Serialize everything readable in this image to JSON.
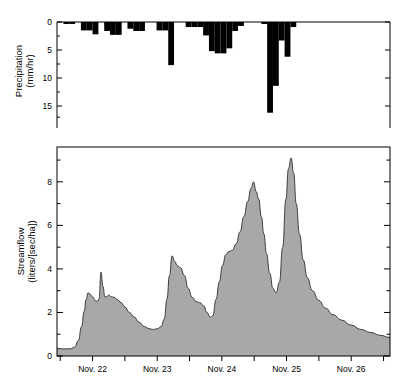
{
  "figure": {
    "background_color": "#ffffff",
    "axis_color": "#000000",
    "precip_bar_color": "#000000",
    "streamflow_fill_color": "#a8a8a8",
    "streamflow_line_color": "#3d3d3d"
  },
  "precip_panel": {
    "y_axis_title_line1": "Precipitation",
    "y_axis_title_line2": "(mm/hr)",
    "y_ticks": [
      "0",
      "5",
      "10",
      "15"
    ]
  },
  "flow_panel": {
    "y_axis_title_line1": "Streamflow",
    "y_axis_title_line2": "(liters/[sec/ha])",
    "y_ticks": [
      "0",
      "2",
      "4",
      "6",
      "8"
    ],
    "x_ticks": [
      "Nov. 22",
      "Nov. 23",
      "Nov. 24",
      "Nov. 25",
      "Nov. 26"
    ]
  },
  "chart_data": [
    {
      "type": "bar",
      "title": "",
      "xlabel": "",
      "ylabel": "Precipitation (mm/hr)",
      "y_axis_inverted": true,
      "ylim": [
        0,
        17.5
      ],
      "yticks": [
        0,
        5,
        10,
        15
      ],
      "xlim": [
        21.45,
        26.6
      ],
      "x_unit": "day of November",
      "bar_width_days": 0.09,
      "grid": false,
      "legend": null,
      "bars": [
        {
          "x": 21.55,
          "value": 0.35
        },
        {
          "x": 21.64,
          "value": 0.35
        },
        {
          "x": 21.73,
          "value": 0.0
        },
        {
          "x": 21.82,
          "value": 1.5
        },
        {
          "x": 21.91,
          "value": 1.5
        },
        {
          "x": 22.0,
          "value": 2.2
        },
        {
          "x": 22.09,
          "value": 0.0
        },
        {
          "x": 22.18,
          "value": 1.6
        },
        {
          "x": 22.27,
          "value": 2.3
        },
        {
          "x": 22.36,
          "value": 2.3
        },
        {
          "x": 22.45,
          "value": 0.0
        },
        {
          "x": 22.54,
          "value": 1.2
        },
        {
          "x": 22.63,
          "value": 1.6
        },
        {
          "x": 22.72,
          "value": 1.6
        },
        {
          "x": 22.81,
          "value": 0.0
        },
        {
          "x": 22.9,
          "value": 0.0
        },
        {
          "x": 22.99,
          "value": 1.5
        },
        {
          "x": 23.08,
          "value": 1.5
        },
        {
          "x": 23.17,
          "value": 7.7
        },
        {
          "x": 23.26,
          "value": 0.0
        },
        {
          "x": 23.35,
          "value": 0.0
        },
        {
          "x": 23.44,
          "value": 0.9
        },
        {
          "x": 23.53,
          "value": 0.9
        },
        {
          "x": 23.62,
          "value": 0.9
        },
        {
          "x": 23.71,
          "value": 2.4
        },
        {
          "x": 23.8,
          "value": 5.2
        },
        {
          "x": 23.89,
          "value": 5.6
        },
        {
          "x": 23.98,
          "value": 5.6
        },
        {
          "x": 24.07,
          "value": 4.7
        },
        {
          "x": 24.16,
          "value": 1.6
        },
        {
          "x": 24.25,
          "value": 0.7
        },
        {
          "x": 24.34,
          "value": 0.0
        },
        {
          "x": 24.43,
          "value": 0.0
        },
        {
          "x": 24.52,
          "value": 0.0
        },
        {
          "x": 24.61,
          "value": 0.35
        },
        {
          "x": 24.7,
          "value": 16.2
        },
        {
          "x": 24.79,
          "value": 11.4
        },
        {
          "x": 24.88,
          "value": 3.3
        },
        {
          "x": 24.97,
          "value": 6.2
        },
        {
          "x": 25.06,
          "value": 0.9
        },
        {
          "x": 25.15,
          "value": 0.0
        },
        {
          "x": 25.24,
          "value": 0.0
        },
        {
          "x": 25.33,
          "value": 0.0
        },
        {
          "x": 25.42,
          "value": 0.0
        },
        {
          "x": 25.51,
          "value": 0.0
        },
        {
          "x": 25.6,
          "value": 0.0
        },
        {
          "x": 25.69,
          "value": 0.0
        },
        {
          "x": 25.78,
          "value": 0.0
        },
        {
          "x": 25.87,
          "value": 0.0
        },
        {
          "x": 25.96,
          "value": 0.0
        },
        {
          "x": 26.05,
          "value": 0.0
        },
        {
          "x": 26.14,
          "value": 0.0
        },
        {
          "x": 26.23,
          "value": 0.0
        },
        {
          "x": 26.32,
          "value": 0.0
        },
        {
          "x": 26.41,
          "value": 0.0
        },
        {
          "x": 26.5,
          "value": 0.0
        }
      ]
    },
    {
      "type": "area",
      "title": "",
      "xlabel": "",
      "ylabel": "Streamflow (liters/[sec/ha])",
      "ylim": [
        0,
        9.6
      ],
      "yticks": [
        0,
        2,
        4,
        6,
        8
      ],
      "xlim": [
        21.45,
        26.6
      ],
      "x_unit": "day of November",
      "xticks": [
        22,
        23,
        24,
        25,
        26
      ],
      "xticklabels": [
        "Nov. 22",
        "Nov. 23",
        "Nov. 24",
        "Nov. 25",
        "Nov. 26"
      ],
      "grid": false,
      "legend": null,
      "series": [
        {
          "name": "Streamflow",
          "x": [
            21.45,
            21.55,
            21.65,
            21.72,
            21.78,
            21.83,
            21.87,
            21.9,
            21.93,
            21.96,
            22.0,
            22.04,
            22.07,
            22.1,
            22.13,
            22.16,
            22.19,
            22.22,
            22.25,
            22.29,
            22.33,
            22.38,
            22.44,
            22.5,
            22.57,
            22.64,
            22.72,
            22.8,
            22.88,
            22.94,
            23.0,
            23.06,
            23.11,
            23.15,
            23.19,
            23.23,
            23.27,
            23.31,
            23.36,
            23.42,
            23.48,
            23.54,
            23.6,
            23.66,
            23.72,
            23.77,
            23.82,
            23.86,
            23.91,
            23.96,
            24.01,
            24.06,
            24.11,
            24.16,
            24.22,
            24.28,
            24.34,
            24.4,
            24.45,
            24.49,
            24.53,
            24.57,
            24.61,
            24.65,
            24.69,
            24.74,
            24.79,
            24.84,
            24.89,
            24.94,
            24.99,
            25.03,
            25.07,
            25.11,
            25.15,
            25.2,
            25.26,
            25.32,
            25.4,
            25.5,
            25.6,
            25.72,
            25.85,
            26.0,
            26.15,
            26.3,
            26.45,
            26.6
          ],
          "y": [
            0.35,
            0.33,
            0.33,
            0.4,
            0.7,
            1.35,
            2.05,
            2.6,
            2.9,
            2.85,
            2.72,
            2.55,
            2.5,
            2.62,
            3.85,
            3.2,
            2.72,
            2.72,
            2.8,
            2.72,
            2.7,
            2.6,
            2.45,
            2.25,
            2.0,
            1.8,
            1.55,
            1.35,
            1.25,
            1.22,
            1.25,
            1.35,
            1.7,
            2.6,
            3.7,
            4.6,
            4.35,
            4.15,
            4.05,
            3.7,
            3.1,
            2.7,
            2.5,
            2.45,
            2.3,
            2.0,
            1.78,
            1.85,
            2.6,
            3.4,
            4.15,
            4.65,
            4.8,
            4.85,
            5.15,
            5.7,
            6.4,
            7.1,
            7.7,
            8.0,
            7.55,
            7.2,
            6.4,
            5.6,
            4.7,
            3.8,
            3.1,
            2.9,
            3.4,
            5.0,
            7.2,
            8.6,
            9.1,
            8.4,
            7.0,
            5.6,
            4.4,
            3.6,
            3.0,
            2.55,
            2.2,
            1.9,
            1.65,
            1.42,
            1.22,
            1.08,
            0.95,
            0.85
          ]
        }
      ]
    }
  ]
}
